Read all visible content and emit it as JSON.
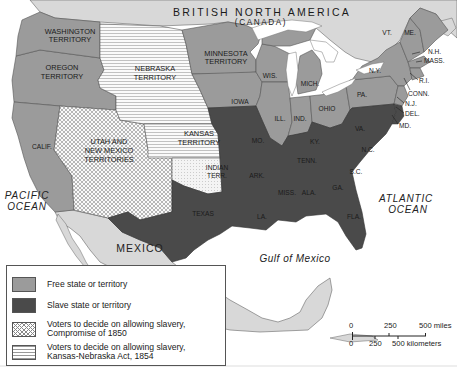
{
  "map": {
    "title_region": {
      "country_top": "BRITISH NORTH AMERICA",
      "country_top_sub": "(CANADA)"
    },
    "regions": {
      "washington": "WASHINGTON",
      "washington_2": "TERRITORY",
      "oregon": "OREGON",
      "oregon_2": "TERRITORY",
      "nebraska": "NEBRASKA",
      "nebraska_2": "TERRITORY",
      "minnesota": "MINNESOTA",
      "minnesota_2": "TERRITORY",
      "utah_nm": "UTAH AND",
      "utah_nm_2": "NEW MEXICO",
      "utah_nm_3": "TERRITORIES",
      "kansas": "KANSAS",
      "kansas_2": "TERRITORY",
      "indian": "INDIAN",
      "indian_2": "TERR.",
      "calif": "CALIF.",
      "iowa": "IOWA",
      "wis": "WIS.",
      "mich": "MICH.",
      "ill": "ILL.",
      "ind": "IND.",
      "ohio": "OHIO",
      "pa": "PA.",
      "ny": "N.Y.",
      "vt": "VT.",
      "me": "ME.",
      "nh": "N.H.",
      "mass": "MASS.",
      "ri": "R.I.",
      "conn": "CONN.",
      "nj": "N.J.",
      "del": "DEL.",
      "md": "MD.",
      "va": "VA.",
      "nc": "N.C.",
      "sc": "S.C.",
      "ga": "GA.",
      "fla": "FLA.",
      "ala": "ALA.",
      "miss": "MISS.",
      "la": "LA.",
      "ark": "ARK.",
      "tenn": "TENN.",
      "ky": "KY.",
      "mo": "MO.",
      "texas": "TEXAS"
    },
    "water": {
      "pacific": "PACIFIC",
      "pacific_2": "OCEAN",
      "atlantic": "ATLANTIC",
      "atlantic_2": "OCEAN",
      "gulf": "Gulf of Mexico"
    },
    "country_south": "MEXICO",
    "colors": {
      "free": "#9b9b9b",
      "slave": "#4a4a4a",
      "foreign": "#d6d6d6",
      "water": "#ffffff",
      "border": "#555555"
    }
  },
  "legend": {
    "items": [
      {
        "label": "Free state or territory",
        "pattern": "solid-gray"
      },
      {
        "label": "Slave state or territory",
        "pattern": "solid-dark"
      },
      {
        "label": "Voters to decide on allowing slavery,",
        "label_2": "Compromise of 1850",
        "pattern": "crosshatch"
      },
      {
        "label": "Voters to decide on allowing slavery,",
        "label_2": "Kansas-Nebraska Act, 1854",
        "pattern": "horizontal-lines"
      }
    ]
  },
  "scale": {
    "miles": {
      "t0": "0",
      "t1": "250",
      "t2": "500 miles"
    },
    "km": {
      "t0": "0",
      "t1": "250",
      "t2": "500 kilometers"
    }
  }
}
